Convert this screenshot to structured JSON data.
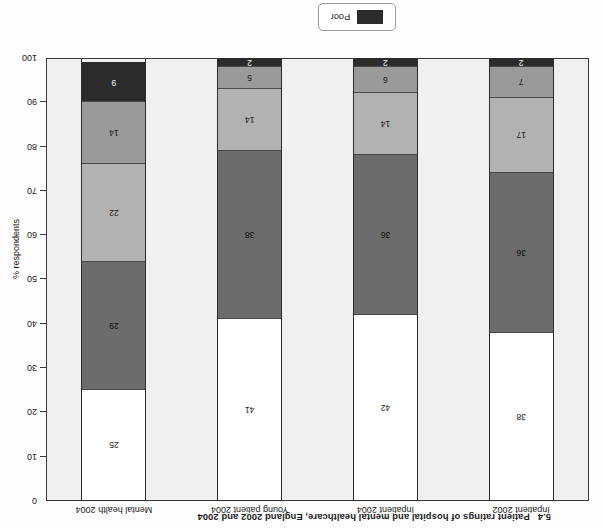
{
  "caption": {
    "number": "5.4",
    "text": "Patient ratings of hospital and mental healthcare, England 2002 and 2004"
  },
  "legend": {
    "label": "Poor",
    "swatch_color": "#2b2b2b"
  },
  "axis": {
    "ylabel": "% respondents",
    "ticks": [
      "0",
      "10",
      "20",
      "30",
      "40",
      "50",
      "60",
      "70",
      "80",
      "90",
      "100"
    ]
  },
  "colors": {
    "excellent": "#ffffff",
    "very_good": "#6c6c6c",
    "good": "#b2b2b2",
    "fair": "#9a9a9a",
    "poor": "#2b2b2b",
    "plot_background": "#f0f0f0",
    "axis_line": "#3a3a3a"
  },
  "chart_data": {
    "type": "bar",
    "xlabel": "",
    "ylabel": "% respondents",
    "ylim": [
      0,
      100
    ],
    "grid": false,
    "stacked": true,
    "legend_position": "bottom",
    "categories": [
      "Inpatient 2002",
      "Inpatient 2004",
      "Young patient 2004",
      "Mental health 2004"
    ],
    "series": [
      {
        "name": "segment-1",
        "color": "#ffffff",
        "label_color": "#1b1b1b",
        "values": [
          38,
          42,
          41,
          25
        ]
      },
      {
        "name": "segment-2",
        "color": "#6c6c6c",
        "label_color": "#0d0d0d",
        "values": [
          36,
          36,
          38,
          29
        ]
      },
      {
        "name": "segment-3",
        "color": "#b2b2b2",
        "label_color": "#1b1b1b",
        "values": [
          17,
          14,
          14,
          22
        ]
      },
      {
        "name": "segment-4",
        "color": "#9a9a9a",
        "label_color": "#1b1b1b",
        "values": [
          7,
          6,
          5,
          14
        ]
      },
      {
        "name": "Poor",
        "color": "#2b2b2b",
        "label_color": "#f2f2f2",
        "values": [
          2,
          2,
          2,
          9
        ]
      }
    ]
  }
}
